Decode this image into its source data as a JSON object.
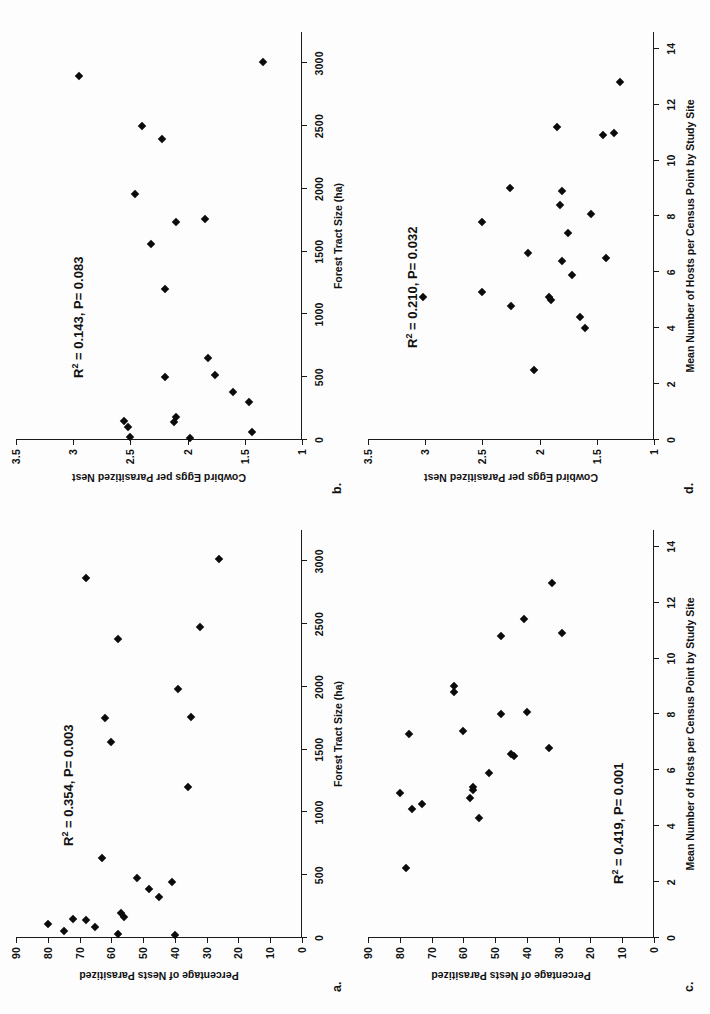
{
  "figure": {
    "orientation": "landscape-content-rotated-90ccw",
    "background": "#fdfdfd",
    "marker_color": "#0b0b0b",
    "axis_color": "#1a1a1a"
  },
  "panels": [
    {
      "key": "a",
      "label": "a.",
      "stat": "R² = 0.354, P= 0.003",
      "stat_r2": 0.354,
      "stat_p": 0.003,
      "chart_data": {
        "type": "scatter",
        "title": "",
        "xlabel": "Forest Tract Size (ha)",
        "ylabel": "Percentage of Nests Parasitized",
        "xlim": [
          0,
          3250
        ],
        "ylim": [
          0,
          90
        ],
        "xticks": [
          0,
          500,
          1000,
          1500,
          2000,
          2500,
          3000
        ],
        "xticklabels": [
          "0",
          "500",
          "1000",
          "1500",
          "2000",
          "2500",
          "3000"
        ],
        "yticks": [
          0,
          10,
          20,
          30,
          40,
          50,
          60,
          70,
          80,
          90
        ],
        "yticklabels": [
          "0",
          "10",
          "20",
          "30",
          "40",
          "50",
          "60",
          "70",
          "80",
          "90"
        ],
        "grid": false,
        "legend": "none",
        "points": [
          [
            20,
            40
          ],
          [
            30,
            58
          ],
          [
            55,
            75
          ],
          [
            90,
            65
          ],
          [
            110,
            80
          ],
          [
            140,
            68
          ],
          [
            150,
            72
          ],
          [
            170,
            56
          ],
          [
            200,
            57
          ],
          [
            330,
            45
          ],
          [
            390,
            48
          ],
          [
            450,
            41
          ],
          [
            480,
            52
          ],
          [
            640,
            63
          ],
          [
            1200,
            36
          ],
          [
            1560,
            60
          ],
          [
            1750,
            62
          ],
          [
            1760,
            35
          ],
          [
            1980,
            39
          ],
          [
            2380,
            58
          ],
          [
            2480,
            32
          ],
          [
            2870,
            68
          ],
          [
            3020,
            26
          ]
        ]
      }
    },
    {
      "key": "b",
      "label": "b.",
      "stat": "R² = 0.143, P= 0.083",
      "stat_r2": 0.143,
      "stat_p": 0.083,
      "chart_data": {
        "type": "scatter",
        "title": "",
        "xlabel": "Forest Tract Size (ha)",
        "ylabel": "Cowbird Eggs per Parasitized Nest",
        "xlim": [
          0,
          3250
        ],
        "ylim": [
          1,
          3.5
        ],
        "xticks": [
          0,
          500,
          1000,
          1500,
          2000,
          2500,
          3000
        ],
        "xticklabels": [
          "0",
          "500",
          "1000",
          "1500",
          "2000",
          "2500",
          "3000"
        ],
        "yticks": [
          1,
          1.5,
          2,
          2.5,
          3,
          3.5
        ],
        "yticklabels": [
          "1",
          "1.5",
          "2",
          "2.5",
          "3",
          "3.5"
        ],
        "grid": false,
        "legend": "none",
        "points": [
          [
            15,
            1.98
          ],
          [
            25,
            2.5
          ],
          [
            60,
            1.44
          ],
          [
            100,
            2.52
          ],
          [
            140,
            2.12
          ],
          [
            150,
            2.56
          ],
          [
            180,
            2.1
          ],
          [
            300,
            1.46
          ],
          [
            380,
            1.6
          ],
          [
            500,
            2.2
          ],
          [
            520,
            1.76
          ],
          [
            650,
            1.82
          ],
          [
            1200,
            2.2
          ],
          [
            1560,
            2.32
          ],
          [
            1740,
            2.1
          ],
          [
            1760,
            1.85
          ],
          [
            1960,
            2.46
          ],
          [
            2400,
            2.22
          ],
          [
            2500,
            2.4
          ],
          [
            2900,
            2.95
          ],
          [
            3010,
            1.34
          ]
        ]
      }
    },
    {
      "key": "c",
      "label": "c.",
      "stat": "R² = 0.419, P= 0.001",
      "stat_r2": 0.419,
      "stat_p": 0.001,
      "chart_data": {
        "type": "scatter",
        "title": "",
        "xlabel": "Mean Number of Hosts per Census Point by Study Site",
        "ylabel": "Percentage of Nests Parasitized",
        "xlim": [
          0,
          14.6
        ],
        "ylim": [
          0,
          90
        ],
        "xticks": [
          0,
          2,
          4,
          6,
          8,
          10,
          12,
          14
        ],
        "xticklabels": [
          "0",
          "2",
          "4",
          "6",
          "8",
          "10",
          "12",
          "14"
        ],
        "yticks": [
          0,
          10,
          20,
          30,
          40,
          50,
          60,
          70,
          80,
          90
        ],
        "yticklabels": [
          "0",
          "10",
          "20",
          "30",
          "40",
          "50",
          "60",
          "70",
          "80",
          "90"
        ],
        "grid": false,
        "legend": "none",
        "points": [
          [
            2.5,
            78
          ],
          [
            4.3,
            55
          ],
          [
            4.6,
            76
          ],
          [
            4.8,
            73
          ],
          [
            5.0,
            58
          ],
          [
            5.2,
            80
          ],
          [
            5.3,
            57
          ],
          [
            5.4,
            57
          ],
          [
            5.9,
            52
          ],
          [
            6.5,
            44
          ],
          [
            6.6,
            45
          ],
          [
            6.8,
            33
          ],
          [
            7.3,
            77
          ],
          [
            7.4,
            60
          ],
          [
            8.0,
            48
          ],
          [
            8.1,
            40
          ],
          [
            8.8,
            63
          ],
          [
            9.0,
            63
          ],
          [
            10.8,
            48
          ],
          [
            10.9,
            29
          ],
          [
            11.4,
            41
          ],
          [
            12.7,
            32
          ]
        ]
      }
    },
    {
      "key": "d",
      "label": "d.",
      "stat": "R² = 0.210, P= 0.032",
      "stat_r2": 0.21,
      "stat_p": 0.032,
      "chart_data": {
        "type": "scatter",
        "title": "",
        "xlabel": "Mean Number of Hosts per Census Point by Study Site",
        "ylabel": "Cowbird Eggs per Parasitized Nest",
        "xlim": [
          0,
          14.6
        ],
        "ylim": [
          1,
          3.5
        ],
        "xticks": [
          0,
          2,
          4,
          6,
          8,
          10,
          12,
          14
        ],
        "xticklabels": [
          "0",
          "2",
          "4",
          "6",
          "8",
          "10",
          "12",
          "14"
        ],
        "yticks": [
          1,
          1.5,
          2,
          2.5,
          3,
          3.5
        ],
        "yticklabels": [
          "1",
          "1.5",
          "2",
          "2.5",
          "3",
          "3.5"
        ],
        "grid": false,
        "legend": "none",
        "points": [
          [
            2.5,
            2.05
          ],
          [
            4.0,
            1.6
          ],
          [
            4.4,
            1.65
          ],
          [
            4.8,
            2.25
          ],
          [
            5.0,
            1.9
          ],
          [
            5.1,
            1.92
          ],
          [
            5.1,
            3.02
          ],
          [
            5.3,
            2.5
          ],
          [
            5.9,
            1.72
          ],
          [
            6.4,
            1.8
          ],
          [
            6.5,
            1.42
          ],
          [
            6.7,
            2.1
          ],
          [
            7.4,
            1.75
          ],
          [
            7.8,
            2.5
          ],
          [
            8.1,
            1.55
          ],
          [
            8.4,
            1.82
          ],
          [
            8.9,
            1.8
          ],
          [
            9.0,
            2.26
          ],
          [
            10.9,
            1.45
          ],
          [
            11.0,
            1.35
          ],
          [
            11.2,
            1.85
          ],
          [
            12.8,
            1.3
          ]
        ]
      }
    }
  ]
}
